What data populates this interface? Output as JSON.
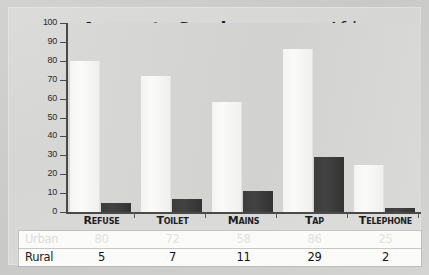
{
  "chart_data": {
    "type": "bar",
    "title": "Access to Services among Africans",
    "title_parts": {
      "bold": "Access to Services",
      "among": " among",
      "tail": " Africans"
    },
    "categories": [
      "Refuse",
      "Toilet",
      "Mains",
      "Tap",
      "Telephone"
    ],
    "series": [
      {
        "name": "Urban",
        "values": [
          80,
          72,
          58,
          86,
          25
        ],
        "color": "#f7f7f5"
      },
      {
        "name": "Rural",
        "values": [
          5,
          7,
          11,
          29,
          2
        ],
        "color": "#3c3c3c"
      }
    ],
    "xlabel": "",
    "ylabel": "",
    "ylim": [
      0,
      100
    ],
    "ytick_labels": [
      "100",
      "90",
      "80",
      "70",
      "60",
      "50",
      "40",
      "30",
      "20",
      "10",
      "0"
    ],
    "ytick_values": [
      100,
      90,
      80,
      70,
      60,
      50,
      40,
      30,
      20,
      10,
      0
    ],
    "grid": false,
    "legend": "table-below"
  },
  "table": {
    "rows": [
      {
        "label": "Urban",
        "cells": [
          "80",
          "72",
          "58",
          "86",
          "25"
        ]
      },
      {
        "label": "Rural",
        "cells": [
          "5",
          "7",
          "11",
          "29",
          "2"
        ]
      }
    ]
  },
  "axis": {
    "labels": [
      "100",
      "90",
      "80",
      "70",
      "60",
      "50",
      "40",
      "30",
      "20",
      "10",
      "0"
    ]
  },
  "categories": [
    "Refuse",
    "Toilet",
    "Mains",
    "Tap",
    "Telephone"
  ],
  "colors": {
    "urban_bar": "#f7f7f5",
    "rural_bar": "#3c3c3c",
    "axis": "#4a4a4a",
    "plot_background": "#d6d6d4",
    "page_background": "#d2d2d0",
    "title_bold": "#1b1b1b",
    "title_among": "#8d8d8d",
    "table_background": "#fbfbfa",
    "urban_text": "#e2e2e2",
    "rural_text": "#141414"
  }
}
